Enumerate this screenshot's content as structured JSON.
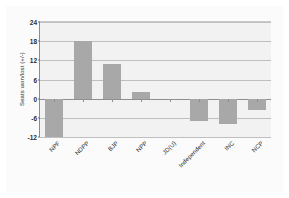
{
  "chart_data": {
    "type": "bar",
    "title": "",
    "subtitle": "",
    "xlabel": "",
    "ylabel": "Seats won/lost (+/-)",
    "categories": [
      "NPF",
      "NDPP",
      "BJP",
      "NPP",
      "JD(U)",
      "Independent",
      "INC",
      "NCP"
    ],
    "values": [
      -12,
      18,
      11,
      2,
      0,
      -7,
      -8,
      -3.5
    ],
    "series": [
      {
        "name": "Seats won/lost",
        "values": [
          -12,
          18,
          11,
          2,
          0,
          -7,
          -8,
          -3.5
        ]
      }
    ],
    "ylim": [
      -12,
      24
    ],
    "yticks": [
      24,
      18,
      12,
      6,
      0,
      -6,
      -12
    ],
    "ytick_labels": [
      "24",
      "18",
      "12",
      "6",
      "0",
      "-6",
      "-12"
    ],
    "grid": true,
    "legend": false,
    "legend_position": "none",
    "bar_color": "#a8a8a8",
    "plot_background": "#f2f2f2",
    "gridline_color": "#bfbfbf",
    "axis_color": "#8c8c8c"
  }
}
